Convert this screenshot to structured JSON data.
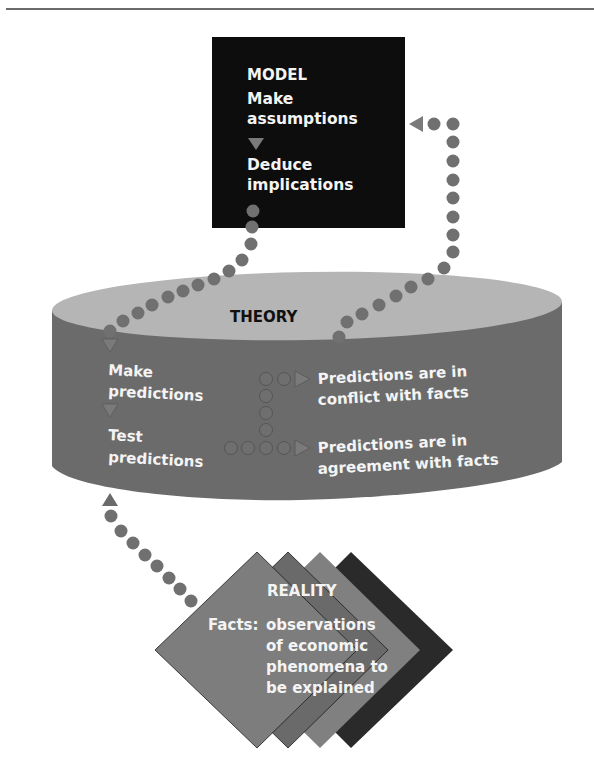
{
  "model": {
    "title": "MODEL",
    "step1_line1": "Make",
    "step1_line2": "assumptions",
    "step2_line1": "Deduce",
    "step2_line2": "implications"
  },
  "theory": {
    "title": "THEORY",
    "step1_line1": "Make",
    "step1_line2": "predictions",
    "step2_line1": "Test",
    "step2_line2": "predictions",
    "outcome_conflict_line1": "Predictions are in",
    "outcome_conflict_line2": "conflict with facts",
    "outcome_agreement_line1": "Predictions are in",
    "outcome_agreement_line2": "agreement with facts"
  },
  "reality": {
    "title": "REALITY",
    "line1_label": "Facts:",
    "line1_text": "observations",
    "line2": "of economic",
    "line3": "phenomena to",
    "line4": "be explained"
  },
  "colors": {
    "model_box": "#0d0d0d",
    "theory_top": "#b5b5b5",
    "theory_body": "#6b6b6b",
    "dots": "#707070",
    "arrow": "#7a7a7a",
    "diamond_1": "#7d7d7d",
    "diamond_2": "#6a6a6a",
    "diamond_3": "#808080",
    "diamond_4": "#2a2a2a"
  }
}
